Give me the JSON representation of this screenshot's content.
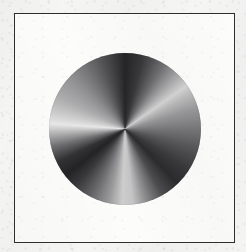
{
  "figure": {
    "title": "Angular (conic) gradient disc",
    "caption": "",
    "medium": "scanned halftone print",
    "background_color": "#f6f6f5",
    "plate_background_color": "#fcfcfb",
    "frame": {
      "name": "plate border",
      "color": "#2e2e2e",
      "stroke_width_px": 1.4,
      "x": 14,
      "y": 13,
      "width": 221,
      "height": 230
    },
    "disc": {
      "name": "conic gradient disc",
      "center_x": 124,
      "center_y": 128,
      "radius": 76,
      "diameter": 152,
      "gradient_type": "conic",
      "gradient_from_angle_deg": 0,
      "stops": [
        {
          "angle_deg": 0,
          "color": "#262628"
        },
        {
          "angle_deg": 14,
          "color": "#39393b"
        },
        {
          "angle_deg": 30,
          "color": "#6e6e70"
        },
        {
          "angle_deg": 44,
          "color": "#a9a9ab"
        },
        {
          "angle_deg": 55,
          "color": "#d6d6d6"
        },
        {
          "angle_deg": 62,
          "color": "#bdbdbe"
        },
        {
          "angle_deg": 74,
          "color": "#9a9a9c"
        },
        {
          "angle_deg": 88,
          "color": "#7d7d80"
        },
        {
          "angle_deg": 104,
          "color": "#5a5a5d"
        },
        {
          "angle_deg": 122,
          "color": "#3a3a3d"
        },
        {
          "angle_deg": 136,
          "color": "#2c2c2f"
        },
        {
          "angle_deg": 150,
          "color": "#4d4d50"
        },
        {
          "angle_deg": 163,
          "color": "#8c8c8e"
        },
        {
          "angle_deg": 174,
          "color": "#c9c9ca"
        },
        {
          "angle_deg": 182,
          "color": "#d2d2d2"
        },
        {
          "angle_deg": 192,
          "color": "#a0a0a2"
        },
        {
          "angle_deg": 206,
          "color": "#6a6a6d"
        },
        {
          "angle_deg": 220,
          "color": "#3c3c3f"
        },
        {
          "angle_deg": 232,
          "color": "#242426"
        },
        {
          "angle_deg": 244,
          "color": "#333336"
        },
        {
          "angle_deg": 256,
          "color": "#6f6f72"
        },
        {
          "angle_deg": 266,
          "color": "#b4b4b5"
        },
        {
          "angle_deg": 274,
          "color": "#ededed"
        },
        {
          "angle_deg": 282,
          "color": "#d3d3d4"
        },
        {
          "angle_deg": 296,
          "color": "#b0b0b1"
        },
        {
          "angle_deg": 312,
          "color": "#97979a"
        },
        {
          "angle_deg": 328,
          "color": "#767679"
        },
        {
          "angle_deg": 344,
          "color": "#4e4e51"
        },
        {
          "angle_deg": 360,
          "color": "#262628"
        }
      ],
      "darkest_color": "#242426",
      "lightest_color": "#ededed"
    }
  }
}
